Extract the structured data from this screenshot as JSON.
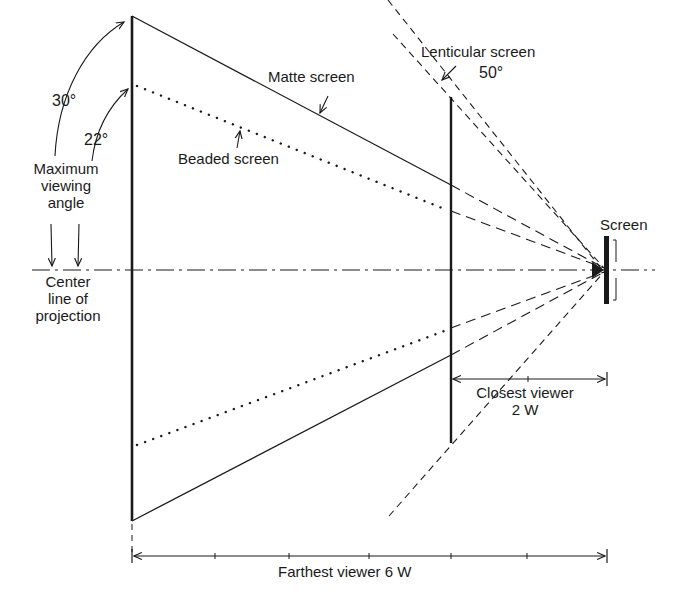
{
  "diagram": {
    "type": "projection screen viewing angle diagram",
    "labels": {
      "matte_screen": "Matte screen",
      "beaded_screen": "Beaded screen",
      "lenticular_screen": "Lenticular screen",
      "lenticular_angle": "50°",
      "matte_angle": "30°",
      "beaded_angle": "22°",
      "max_viewing_angle_l1": "Maximum",
      "max_viewing_angle_l2": "viewing",
      "max_viewing_angle_l3": "angle",
      "center_line_l1": "Center",
      "center_line_l2": "line of",
      "center_line_l3": "projection",
      "screen": "Screen",
      "closest_viewer_l1": "Closest viewer",
      "closest_viewer_l2": "2 W",
      "farthest_viewer": "Farthest viewer 6 W"
    },
    "screen_types": [
      {
        "name": "Matte screen",
        "max_angle_deg": 30,
        "line_style": "solid"
      },
      {
        "name": "Beaded screen",
        "max_angle_deg": 22,
        "line_style": "dotted"
      },
      {
        "name": "Lenticular screen",
        "max_angle_deg": 50,
        "line_style": "dashed"
      }
    ],
    "distances": {
      "closest_viewer": "2 W",
      "farthest_viewer": "6 W"
    },
    "colors": {
      "ink": "#1a1a1a",
      "background": "#ffffff"
    }
  }
}
